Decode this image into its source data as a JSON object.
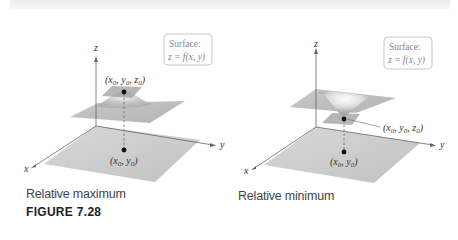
{
  "figure": {
    "number_label": "FIGURE 7.28",
    "panels": [
      {
        "id": "left",
        "caption": "Relative maximum",
        "surface_box": {
          "line1": "Surface:",
          "line2": "z = f(x, y)"
        },
        "axes": {
          "x": "x",
          "y": "y",
          "z": "z"
        },
        "point_label": "(x0, y0, z0)",
        "base_label": "(x0, y0)"
      },
      {
        "id": "right",
        "caption": "Relative minimum",
        "surface_box": {
          "line1": "Surface:",
          "line2": "z = f(x, y)"
        },
        "axes": {
          "x": "x",
          "y": "y",
          "z": "z"
        },
        "point_label": "(x0, y0, z0)",
        "base_label": "(x0, y0)"
      }
    ]
  },
  "colors": {
    "plane": "#c9c9c9",
    "surface": "#bdbdbd",
    "axis": "#666666",
    "box_border": "#c8c8c8",
    "dash": "#777777"
  }
}
